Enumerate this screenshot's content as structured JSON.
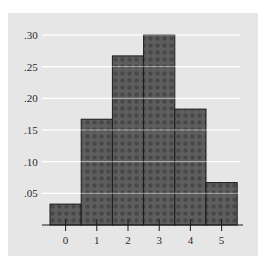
{
  "chart_data": {
    "type": "bar",
    "title": "",
    "xlabel": "",
    "ylabel": "",
    "categories": [
      "0",
      "1",
      "2",
      "3",
      "4",
      "5"
    ],
    "values": [
      0.033,
      0.167,
      0.267,
      0.3,
      0.183,
      0.067
    ],
    "ylim": [
      0,
      0.3
    ],
    "yticks": [
      0.05,
      0.1,
      0.15,
      0.2,
      0.25,
      0.3
    ],
    "ytick_labels": [
      ".05",
      ".10",
      ".15",
      ".20",
      ".25",
      ".30"
    ],
    "grid": true,
    "legend": null,
    "bar_style": "histogram (adjacent bars, no gaps)"
  },
  "colors": {
    "panel_background": "#e6e6e6",
    "bar_fill": "#5e5e5e",
    "bar_outline": "#1a1a1a",
    "gridline": "#ffffff",
    "text": "#2a2a2a"
  }
}
